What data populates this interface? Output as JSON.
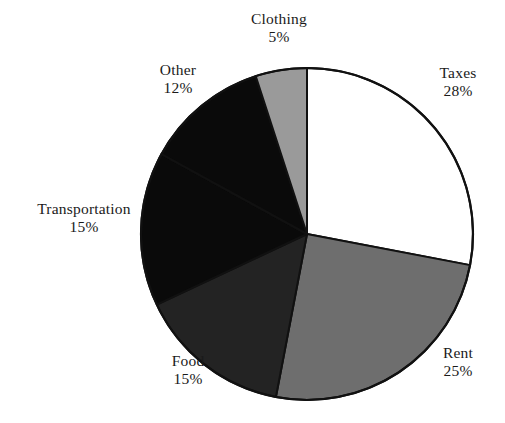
{
  "chart_data": {
    "type": "pie",
    "title": "",
    "subtitle": "",
    "xlabel": "",
    "ylabel": "",
    "grid": false,
    "legend_position": "none",
    "labels_outside": true,
    "start_angle_deg": 0,
    "direction": "clockwise",
    "units": "percent",
    "total": 100,
    "categories": [
      "Taxes",
      "Rent",
      "Food",
      "Transportation",
      "Other",
      "Clothing"
    ],
    "values": [
      28,
      25,
      15,
      15,
      12,
      5
    ],
    "slices": [
      {
        "name": "Taxes",
        "value": 28,
        "value_label": "28%",
        "fill": "#ffffff",
        "stroke": "#111111",
        "start_deg": 0,
        "end_deg": 100.8
      },
      {
        "name": "Rent",
        "value": 25,
        "value_label": "25%",
        "fill": "#6e6e6e",
        "stroke": "#111111",
        "start_deg": 100.8,
        "end_deg": 190.8
      },
      {
        "name": "Food",
        "value": 15,
        "value_label": "15%",
        "fill": "#232323",
        "stroke": "#111111",
        "start_deg": 190.8,
        "end_deg": 244.8
      },
      {
        "name": "Transportation",
        "value": 15,
        "value_label": "15%",
        "fill": "#0a0a0a",
        "stroke": "#111111",
        "start_deg": 244.8,
        "end_deg": 298.8
      },
      {
        "name": "Other",
        "value": 12,
        "value_label": "12%",
        "fill": "#0a0a0a",
        "stroke": "#111111",
        "start_deg": 298.8,
        "end_deg": 342.0
      },
      {
        "name": "Clothing",
        "value": 5,
        "value_label": "5%",
        "fill": "#9a9a9a",
        "stroke": "#111111",
        "start_deg": 342.0,
        "end_deg": 360.0
      }
    ],
    "geometry": {
      "center_x": 307,
      "center_y": 234,
      "radius": 166
    },
    "colors": {
      "background": "#ffffff",
      "outline": "#111111",
      "text": "#1a1a1a"
    }
  }
}
